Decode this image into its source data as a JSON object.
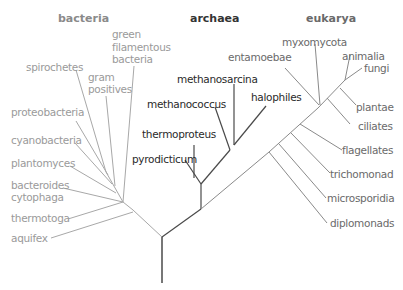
{
  "headers": {
    "bacteria": "bacteria",
    "archaea": "archaea",
    "eukarya": "eukarya"
  },
  "bacteria": {
    "green": "green",
    "filamentous": "filamentous",
    "bacteria": "bacteria",
    "spirochetes": "spirochetes",
    "gram": "gram",
    "positives": "positives",
    "proteobacteria": "proteobacteria",
    "cyanobacteria": "cyanobacteria",
    "plantomyces": "plantomyces",
    "bacteroides": "bacteroides",
    "cytophaga": "cytophaga",
    "thermotoga": "thermotoga",
    "aquifex": "aquifex"
  },
  "archaea": {
    "methanosarcina": "methanosarcina",
    "methanococcus": "methanococcus",
    "halophiles": "halophiles",
    "thermoproteus": "thermoproteus",
    "pyrodicticum": "pyrodicticum"
  },
  "eukarya": {
    "entamoebae": "entamoebae",
    "myxomycota": "myxomycota",
    "animalia": "animalia",
    "fungi": "fungi",
    "plantae": "plantae",
    "ciliates": "ciliates",
    "flagellates": "flagellates",
    "trichomonad": "trichomonad",
    "microsporidia": "microsporidia",
    "diplomonads": "diplomonads"
  },
  "colors": {
    "bacteria": "#9a9a9a",
    "archaea": "#2a2a2a",
    "eukarya": "#6a6a6a",
    "trunk": "#444444"
  }
}
